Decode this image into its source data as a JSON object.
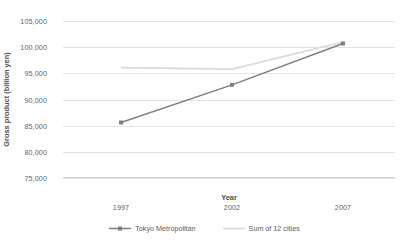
{
  "chart_data": {
    "type": "line",
    "title": "",
    "xlabel": "Year",
    "ylabel": "Gross product (billion yen)",
    "categories": [
      "1997",
      "2002",
      "2007"
    ],
    "x_tick_labels": [
      "1997",
      "2002",
      "2007"
    ],
    "y_tick_labels": [
      "105,000",
      "100,000",
      "95,000",
      "90,000",
      "85,000",
      "80,000",
      "75,000"
    ],
    "y_tick_values": [
      105000,
      100000,
      95000,
      90000,
      85000,
      80000,
      75000
    ],
    "ylim": [
      75000,
      105000
    ],
    "y_tick_step": 5000,
    "grid": "horizontal",
    "legend_position": "bottom",
    "series": [
      {
        "name": "Tokyo Metropolitan",
        "color": "#7f7f7f",
        "marker": "diamond",
        "values": [
          85600,
          92800,
          100700
        ]
      },
      {
        "name": "Sum of 12 cities",
        "color": "#d9d9d9",
        "marker": "none",
        "values": [
          96100,
          95800,
          101000
        ]
      }
    ]
  },
  "legend": {
    "entries": [
      {
        "label": "Tokyo Metropolitan"
      },
      {
        "label": "Sum of 12 cities"
      }
    ]
  },
  "colors": {
    "series_tokyo": "#7f7f7f",
    "series_sum": "#d9d9d9",
    "gridline": "#e2e2e2",
    "text": "#595959",
    "background": "#ffffff"
  }
}
